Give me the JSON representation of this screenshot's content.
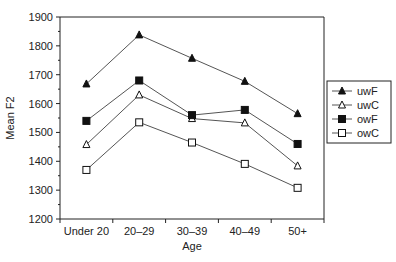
{
  "chart_data": {
    "type": "line",
    "title": "",
    "xlabel": "Age",
    "ylabel": "Mean F2",
    "categories": [
      "Under 20",
      "20–29",
      "30–39",
      "40–49",
      "50+"
    ],
    "ylim": [
      1200,
      1900
    ],
    "yticks": [
      1200,
      1300,
      1400,
      1500,
      1600,
      1700,
      1800,
      1900
    ],
    "grid": false,
    "legend_position": "right",
    "series": [
      {
        "name": "uwF",
        "marker": "triangle-filled",
        "values": [
          1668,
          1838,
          1757,
          1677,
          1565
        ]
      },
      {
        "name": "uwC",
        "marker": "triangle-open",
        "values": [
          1458,
          1630,
          1548,
          1533,
          1384
        ]
      },
      {
        "name": "owF",
        "marker": "square-filled",
        "values": [
          1540,
          1680,
          1560,
          1578,
          1460
        ]
      },
      {
        "name": "owC",
        "marker": "square-open",
        "values": [
          1370,
          1535,
          1465,
          1391,
          1308
        ]
      }
    ]
  },
  "colors": {
    "line": "#555555",
    "marker": "#111111",
    "axis": "#222222"
  }
}
